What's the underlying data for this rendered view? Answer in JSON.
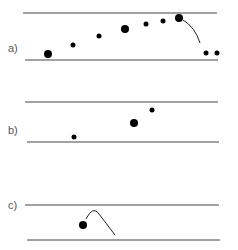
{
  "panels": [
    {
      "label": "a)",
      "label_pos": [
        8,
        52
      ],
      "top_line": {
        "x1": 23,
        "x2": 217,
        "y": 13
      },
      "bottom_line": {
        "x1": 25,
        "x2": 218,
        "y": 60
      },
      "dots": [
        {
          "x": 48,
          "y": 54,
          "r": 4
        },
        {
          "x": 73,
          "y": 45,
          "r": 2.5
        },
        {
          "x": 99,
          "y": 36,
          "r": 2.5
        },
        {
          "x": 125,
          "y": 29,
          "r": 4
        },
        {
          "x": 146,
          "y": 24,
          "r": 2.5
        },
        {
          "x": 163,
          "y": 21,
          "r": 2.5
        },
        {
          "x": 179,
          "y": 18,
          "r": 4
        },
        {
          "x": 206,
          "y": 53,
          "r": 2.5
        },
        {
          "x": 217,
          "y": 53,
          "r": 2.5
        }
      ],
      "curves": [
        "M 183 20 Q 195 27 200 43"
      ]
    },
    {
      "label": "b)",
      "label_pos": [
        8,
        134
      ],
      "top_line": {
        "x1": 25,
        "x2": 218,
        "y": 102
      },
      "bottom_line": {
        "x1": 27,
        "x2": 219,
        "y": 142
      },
      "dots": [
        {
          "x": 74,
          "y": 137,
          "r": 2.5
        },
        {
          "x": 134,
          "y": 123,
          "r": 4
        },
        {
          "x": 152,
          "y": 110,
          "r": 2.5
        }
      ],
      "curves": []
    },
    {
      "label": "c)",
      "label_pos": [
        8,
        209
      ],
      "top_line": {
        "x1": 25,
        "x2": 219,
        "y": 205
      },
      "bottom_line": {
        "x1": 27,
        "x2": 220,
        "y": 240
      },
      "dots": [
        {
          "x": 83,
          "y": 225,
          "r": 4
        }
      ],
      "curves": [
        "M 86 219 Q 93 205 99 214 L 115 235"
      ]
    }
  ]
}
